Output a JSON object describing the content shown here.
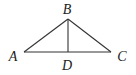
{
  "diagram": {
    "type": "geometry",
    "points": {
      "A": {
        "label": "A",
        "x": 24,
        "y": 52,
        "lx": 13,
        "ly": 61
      },
      "B": {
        "label": "B",
        "x": 68,
        "y": 19,
        "lx": 67,
        "ly": 14
      },
      "C": {
        "label": "C",
        "x": 111,
        "y": 52,
        "lx": 122,
        "ly": 61
      },
      "D": {
        "label": "D",
        "x": 68,
        "y": 52,
        "lx": 67,
        "ly": 70
      }
    },
    "segments": [
      [
        "A",
        "B"
      ],
      [
        "B",
        "C"
      ],
      [
        "A",
        "C"
      ],
      [
        "B",
        "D"
      ]
    ]
  }
}
